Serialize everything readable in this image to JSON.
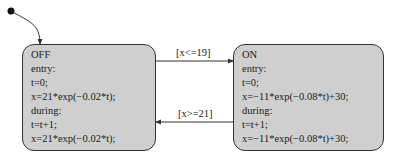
{
  "diagram": {
    "states": [
      {
        "name": "OFF",
        "lines": [
          "OFF",
          "entry:",
          "t=0;",
          "x=21*exp(−0.02*t);",
          "during:",
          "t=t+1;",
          "x=21*exp(−0.02*t);"
        ]
      },
      {
        "name": "ON",
        "lines": [
          "ON",
          "entry:",
          "t=0;",
          "x=−11*exp(−0.08*t)+30;",
          "during:",
          "t=t+1;",
          "x=−11*exp(−0.08*t)+30;"
        ]
      }
    ],
    "transitions": [
      {
        "from": "OFF",
        "to": "ON",
        "guard": "[x<=19]"
      },
      {
        "from": "ON",
        "to": "OFF",
        "guard": "[x>=21]"
      }
    ],
    "default_transition": {
      "to": "OFF"
    },
    "colors": {
      "state_fill": "#cfcfcf",
      "stroke": "#333333"
    }
  }
}
